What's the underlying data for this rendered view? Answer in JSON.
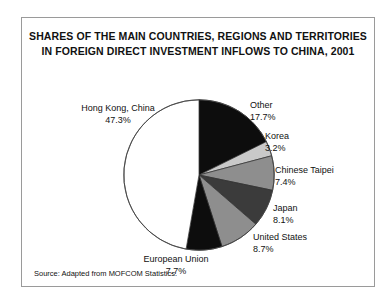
{
  "figure": {
    "title_line_1": "SHARES OF THE MAIN COUNTRIES, REGIONS AND TERRITORIES",
    "title_line_2": "IN FOREIGN DIRECT INVESTMENT INFLOWS TO CHINA, 2001",
    "source_note": "Source: Adapted from MOFCOM Statistics.",
    "border_color": "#9a9a9a"
  },
  "chart_data": {
    "type": "pie",
    "title": "SHARES OF THE MAIN COUNTRIES, REGIONS AND TERRITORIES IN FOREIGN DIRECT INVESTMENT INFLOWS TO CHINA, 2001",
    "subtitle": "",
    "xlabel": "",
    "ylabel": "",
    "units": "percent",
    "legend_position": "none",
    "grid": false,
    "start_angle_deg": 0,
    "direction": "clockwise",
    "categories": [
      "Other",
      "Korea",
      "Chinese Taipei",
      "Japan",
      "United States",
      "European Union",
      "Hong Kong, China"
    ],
    "values": [
      17.7,
      3.2,
      7.4,
      8.1,
      8.7,
      7.7,
      47.3
    ],
    "labels": [
      "17.7%",
      "3.2%",
      "7.4%",
      "8.1%",
      "8.7%",
      "7.7%",
      "47.3%"
    ],
    "colors": [
      "#0d0d0d",
      "#c9c9c9",
      "#8e8e8e",
      "#3b3b3b",
      "#8e8e8e",
      "#0d0d0d",
      "#ffffff"
    ],
    "slices": [
      {
        "name": "Other",
        "value": 17.7,
        "label": "17.7%",
        "color": "#0d0d0d"
      },
      {
        "name": "Korea",
        "value": 3.2,
        "label": "3.2%",
        "color": "#c9c9c9"
      },
      {
        "name": "Chinese Taipei",
        "value": 7.4,
        "label": "7.4%",
        "color": "#8e8e8e"
      },
      {
        "name": "Japan",
        "value": 8.1,
        "label": "8.1%",
        "color": "#3b3b3b"
      },
      {
        "name": "United States",
        "value": 8.7,
        "label": "8.7%",
        "color": "#8e8e8e"
      },
      {
        "name": "European Union",
        "value": 7.7,
        "label": "7.7%",
        "color": "#0d0d0d"
      },
      {
        "name": "Hong Kong, China",
        "value": 47.3,
        "label": "47.3%",
        "color": "#ffffff"
      }
    ]
  }
}
